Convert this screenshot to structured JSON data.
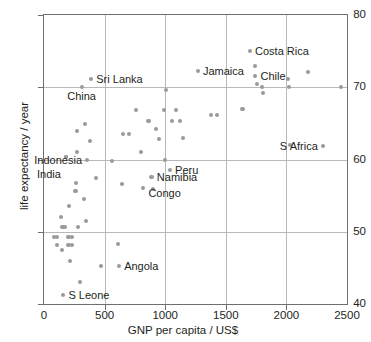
{
  "chart_data": {
    "type": "scatter",
    "title": "",
    "xlabel": "GNP per capita / US$",
    "ylabel": "life expectancy / year",
    "xlim": [
      0,
      2500
    ],
    "ylim": [
      40,
      80
    ],
    "xticks": [
      0,
      500,
      1000,
      1500,
      2000,
      2500
    ],
    "yticks": [
      40,
      50,
      60,
      70,
      80
    ],
    "grid": "major gridlines at 500/1000/1500/2000 on x and 50/60/70 on y",
    "legend": "none",
    "marker_color": "#9a9a9a",
    "axis_color": "#6f6f6f",
    "grid_color": "#b9b9b9",
    "text_color": "#231f20",
    "points": [
      {
        "x": 80,
        "y": 49.3
      },
      {
        "x": 110,
        "y": 49.3
      },
      {
        "x": 110,
        "y": 48.2
      },
      {
        "x": 140,
        "y": 52.1
      },
      {
        "x": 150,
        "y": 50.6
      },
      {
        "x": 150,
        "y": 47.5
      },
      {
        "x": 160,
        "y": 50.6
      },
      {
        "x": 170,
        "y": 50.6
      },
      {
        "x": 160,
        "y": 41.3
      },
      {
        "x": 180,
        "y": 60.3
      },
      {
        "x": 185,
        "y": 60.3
      },
      {
        "x": 195,
        "y": 49.3
      },
      {
        "x": 205,
        "y": 49.3
      },
      {
        "x": 200,
        "y": 48.2
      },
      {
        "x": 210,
        "y": 48.2
      },
      {
        "x": 210,
        "y": 53.5
      },
      {
        "x": 230,
        "y": 49.3
      },
      {
        "x": 235,
        "y": 48.2
      },
      {
        "x": 215,
        "y": 46.0
      },
      {
        "x": 255,
        "y": 55.6
      },
      {
        "x": 260,
        "y": 55.6
      },
      {
        "x": 265,
        "y": 56.8
      },
      {
        "x": 270,
        "y": 61.1
      },
      {
        "x": 275,
        "y": 64.0
      },
      {
        "x": 280,
        "y": 50.6
      },
      {
        "x": 300,
        "y": 43.0
      },
      {
        "x": 310,
        "y": 70.0
      },
      {
        "x": 330,
        "y": 54.6
      },
      {
        "x": 340,
        "y": 64.9
      },
      {
        "x": 350,
        "y": 51.5
      },
      {
        "x": 355,
        "y": 60.0
      },
      {
        "x": 380,
        "y": 62.5
      },
      {
        "x": 390,
        "y": 71.2
      },
      {
        "x": 430,
        "y": 57.5
      },
      {
        "x": 470,
        "y": 45.3
      },
      {
        "x": 560,
        "y": 59.8
      },
      {
        "x": 610,
        "y": 48.3
      },
      {
        "x": 620,
        "y": 45.2
      },
      {
        "x": 640,
        "y": 56.6
      },
      {
        "x": 650,
        "y": 63.5
      },
      {
        "x": 700,
        "y": 63.5
      },
      {
        "x": 760,
        "y": 66.8
      },
      {
        "x": 800,
        "y": 61.0
      },
      {
        "x": 820,
        "y": 56.0
      },
      {
        "x": 855,
        "y": 65.3
      },
      {
        "x": 870,
        "y": 65.3
      },
      {
        "x": 880,
        "y": 57.6
      },
      {
        "x": 890,
        "y": 57.6
      },
      {
        "x": 900,
        "y": 55.9
      },
      {
        "x": 920,
        "y": 64.2
      },
      {
        "x": 950,
        "y": 62.8
      },
      {
        "x": 990,
        "y": 66.8
      },
      {
        "x": 1000,
        "y": 60.0
      },
      {
        "x": 1010,
        "y": 69.6
      },
      {
        "x": 1040,
        "y": 58.5
      },
      {
        "x": 1060,
        "y": 65.3
      },
      {
        "x": 1090,
        "y": 66.9
      },
      {
        "x": 1120,
        "y": 65.3
      },
      {
        "x": 1150,
        "y": 63.0
      },
      {
        "x": 1270,
        "y": 72.2
      },
      {
        "x": 1380,
        "y": 66.2
      },
      {
        "x": 1430,
        "y": 66.2
      },
      {
        "x": 1630,
        "y": 67.0
      },
      {
        "x": 1640,
        "y": 67.0
      },
      {
        "x": 1700,
        "y": 75.0
      },
      {
        "x": 1740,
        "y": 72.9
      },
      {
        "x": 1745,
        "y": 71.6
      },
      {
        "x": 1760,
        "y": 70.4
      },
      {
        "x": 1800,
        "y": 70.0
      },
      {
        "x": 1810,
        "y": 69.2
      },
      {
        "x": 2010,
        "y": 71.2
      },
      {
        "x": 2020,
        "y": 70.0
      },
      {
        "x": 2030,
        "y": 62.0
      },
      {
        "x": 2180,
        "y": 72.1
      },
      {
        "x": 2300,
        "y": 61.9
      },
      {
        "x": 2450,
        "y": 70.0
      }
    ],
    "annotations": [
      {
        "label": "Sri Lanka",
        "x": 390,
        "y": 71.2,
        "align": "right"
      },
      {
        "label": "China",
        "x": 310,
        "y": 70.0,
        "align": "below"
      },
      {
        "label": "Jamaica",
        "x": 1270,
        "y": 72.2,
        "align": "right"
      },
      {
        "label": "Costa Rica",
        "x": 1700,
        "y": 75.0,
        "align": "right"
      },
      {
        "label": "Chile",
        "x": 1745,
        "y": 71.6,
        "align": "right"
      },
      {
        "label": "S Africa",
        "x": 2300,
        "y": 61.9,
        "align": "left"
      },
      {
        "label": "Peru",
        "x": 1040,
        "y": 58.5,
        "align": "right"
      },
      {
        "label": "Indonesia",
        "x": 355,
        "y": 60.0,
        "align": "left"
      },
      {
        "label": "India",
        "x": 180,
        "y": 58.0,
        "align": "left"
      },
      {
        "label": "Namibia",
        "x": 890,
        "y": 57.6,
        "align": "right"
      },
      {
        "label": "Congo",
        "x": 820,
        "y": 55.3,
        "align": "right"
      },
      {
        "label": "Angola",
        "x": 620,
        "y": 45.2,
        "align": "right"
      },
      {
        "label": "S Leone",
        "x": 160,
        "y": 41.3,
        "align": "right"
      }
    ]
  }
}
